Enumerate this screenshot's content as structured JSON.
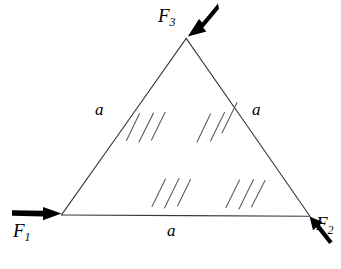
{
  "figure": {
    "shape": "equilateral-triangle",
    "line_color": "#3a3a3a",
    "hatch_color": "#5a5a5a",
    "arrow_color": "#000000",
    "background_color": "#ffffff"
  },
  "labels": {
    "force_1": "F",
    "force_1_sub": "1",
    "force_2": "F",
    "force_2_sub": "2",
    "force_3": "F",
    "force_3_sub": "3",
    "side_left": "a",
    "side_right": "a",
    "side_bottom": "a"
  },
  "geometry": {
    "vertex_apex": [
      186,
      38
    ],
    "vertex_bottom_left": [
      61,
      215
    ],
    "vertex_bottom_right": [
      310,
      216
    ]
  },
  "forces": [
    {
      "name": "F1",
      "label": "F",
      "subscript": "1",
      "direction": "right",
      "applied_at": "bottom-left-vertex",
      "tail": [
        12,
        213
      ],
      "head": [
        61,
        214
      ]
    },
    {
      "name": "F2",
      "label": "F",
      "subscript": "2",
      "direction": "up-left",
      "applied_at": "bottom-right-vertex",
      "tail": [
        331,
        244
      ],
      "head": [
        310,
        217
      ]
    },
    {
      "name": "F3",
      "label": "F",
      "subscript": "3",
      "direction": "down-left",
      "applied_at": "apex-vertex",
      "tail": [
        216,
        2
      ],
      "head": [
        188,
        36
      ]
    }
  ],
  "sides": [
    {
      "name": "left-side",
      "label": "a",
      "from": "bottom-left-vertex",
      "to": "apex-vertex"
    },
    {
      "name": "right-side",
      "label": "a",
      "from": "apex-vertex",
      "to": "bottom-right-vertex"
    },
    {
      "name": "bottom-side",
      "label": "a",
      "from": "bottom-left-vertex",
      "to": "bottom-right-vertex"
    }
  ],
  "hatch_groups": [
    {
      "name": "upper-left",
      "strokes": 3,
      "angle_deg": 62
    },
    {
      "name": "upper-right",
      "strokes": 3,
      "angle_deg": 62
    },
    {
      "name": "lower-left",
      "strokes": 3,
      "angle_deg": 62
    },
    {
      "name": "lower-right",
      "strokes": 3,
      "angle_deg": 62
    }
  ]
}
